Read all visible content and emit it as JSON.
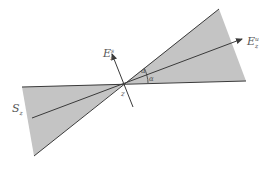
{
  "diagram": {
    "labels": {
      "stable_direction": {
        "base": "E",
        "sub": "z",
        "sup": "s"
      },
      "unstable_direction": {
        "base": "E",
        "sub": "z",
        "sup": "u"
      },
      "angle_upper": "α",
      "angle_lower": "α",
      "point": "z",
      "cone": {
        "base": "S",
        "sub": "z"
      }
    },
    "colors": {
      "cone_fill": "#c4c4c4",
      "line": "#3a3a3a",
      "label": "#555555"
    }
  }
}
